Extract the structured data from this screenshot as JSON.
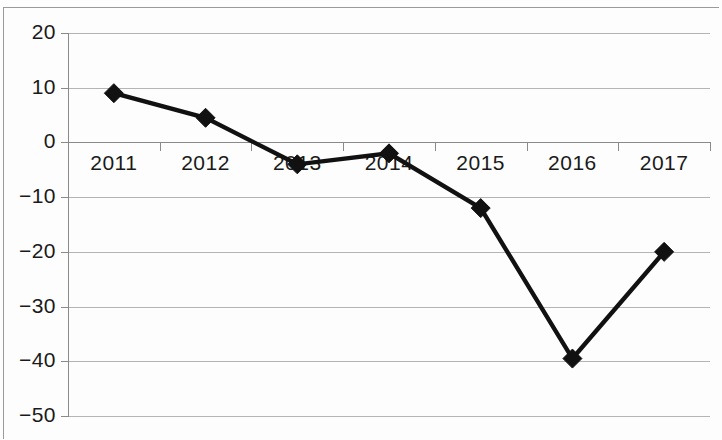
{
  "chart_data": {
    "type": "line",
    "title": "",
    "subtitle": "",
    "xlabel": "",
    "ylabel": "",
    "categories": [
      "2011",
      "2012",
      "2013",
      "2014",
      "2015",
      "2016",
      "2017"
    ],
    "values": [
      9,
      4.5,
      -4,
      -2,
      -12,
      -39.5,
      -20
    ],
    "series": [
      {
        "name": "",
        "values": [
          9,
          4.5,
          -4,
          -2,
          -12,
          -39.5,
          -20
        ]
      }
    ],
    "ylim": [
      -50,
      20
    ],
    "yticks": [
      20,
      10,
      0,
      -10,
      -20,
      -30,
      -40,
      -50
    ],
    "ytick_labels": [
      "20",
      "10",
      "0",
      "−10",
      "−20",
      "−30",
      "−40",
      "−50"
    ],
    "grid": true,
    "grid_axis": "y",
    "legend": false,
    "legend_position": "none",
    "marker": "diamond",
    "marker_color": "#111111",
    "line_color": "#111111",
    "background_color": "#ffffff",
    "gridline_color": "#b4b4b4",
    "axis_color": "#8a8a8a",
    "xaxis_position": "zero",
    "annotations": []
  }
}
